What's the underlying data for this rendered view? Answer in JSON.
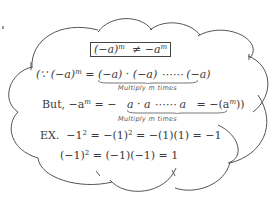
{
  "note": {
    "title_formula": {
      "lhs": "(−a)",
      "lhs_exp": "m",
      "relation": "≠",
      "rhs": "−a",
      "rhs_exp": "m"
    },
    "line1": {
      "prefix": "(∵ (−a)",
      "prefix_exp": "m",
      "equals": "=",
      "product": "(−a) · (−a) ⋯⋯ (−a)",
      "caption": "Multiply m times"
    },
    "line2": {
      "prefix": "But, −a",
      "prefix_exp": "m",
      "equals": "= −",
      "product": "a · a ⋯⋯ a",
      "suffix": "= −(a",
      "suffix_exp": "m",
      "suffix_end": "))",
      "caption": "Multiply m times"
    },
    "example1": {
      "label": "EX.",
      "part1": "−1",
      "part1_exp": "2",
      "part2": "= −(1)",
      "part2_exp": "2",
      "part3": "= −(1)(1) = −1"
    },
    "example2": {
      "part1": "(−1)",
      "part1_exp": "2",
      "part2": "= (−1)(−1) = 1"
    }
  },
  "colors": {
    "stroke": "#555555",
    "text": "#3a3a3a",
    "background": "#ffffff"
  }
}
